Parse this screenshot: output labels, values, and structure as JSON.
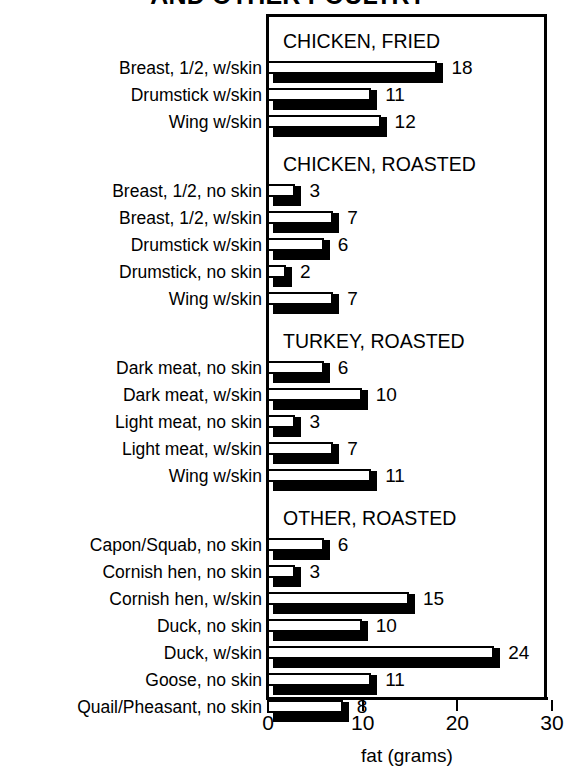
{
  "title": "AND OTHER POULTRY",
  "chart_data": {
    "type": "bar",
    "orientation": "horizontal",
    "title": "AND OTHER POULTRY",
    "xlabel": "fat (grams)",
    "ylabel": "",
    "xlim": [
      0,
      30
    ],
    "xticks": [
      0,
      10,
      20,
      30
    ],
    "xticklabels": [
      "0",
      "10",
      "20",
      "30"
    ],
    "grid": false,
    "legend": null,
    "style": "3d-outlined-bars",
    "units": "grams of fat",
    "groups": [
      {
        "header": "CHICKEN, FRIED",
        "categories": [
          "Breast, 1/2, w/skin",
          "Drumstick w/skin",
          "Wing w/skin"
        ],
        "values": [
          18,
          11,
          12
        ]
      },
      {
        "header": "CHICKEN, ROASTED",
        "categories": [
          "Breast, 1/2, no skin",
          "Breast, 1/2, w/skin",
          "Drumstick w/skin",
          "Drumstick, no skin",
          "Wing w/skin"
        ],
        "values": [
          3,
          7,
          6,
          2,
          7
        ]
      },
      {
        "header": "TURKEY, ROASTED",
        "categories": [
          "Dark meat, no skin",
          "Dark meat, w/skin",
          "Light meat, no skin",
          "Light meat, w/skin",
          "Wing w/skin"
        ],
        "values": [
          6,
          10,
          3,
          7,
          11
        ]
      },
      {
        "header": "OTHER, ROASTED",
        "categories": [
          "Capon/Squab, no skin",
          "Cornish hen, no skin",
          "Cornish hen, w/skin",
          "Duck, no skin",
          "Duck, w/skin",
          "Goose, no skin",
          "Quail/Pheasant, no skin"
        ],
        "values": [
          6,
          3,
          15,
          10,
          24,
          11,
          8
        ]
      }
    ]
  },
  "axis": {
    "x_title": "fat (grams)",
    "ticks": [
      "0",
      "10",
      "20",
      "30"
    ]
  },
  "colors": {
    "ink": "#000000",
    "paper": "#ffffff",
    "bar_face": "#ffffff",
    "bar_shadow": "#000000"
  }
}
